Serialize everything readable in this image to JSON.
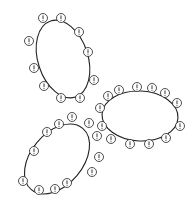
{
  "diagram": {
    "stroke_color": "#222222",
    "background": "#ffffff",
    "marker_glyph": "!",
    "marker_radius": 4.5,
    "loops": [
      {
        "name": "top-left-loop",
        "ellipse": {
          "cx": 63,
          "cy": 59,
          "rx": 25,
          "ry": 40,
          "rotate": -18
        },
        "markers": [
          [
            43,
            18
          ],
          [
            61,
            18
          ],
          [
            79,
            32
          ],
          [
            29,
            41
          ],
          [
            88,
            52
          ],
          [
            34,
            68
          ],
          [
            94,
            80
          ],
          [
            44,
            86
          ],
          [
            61,
            98
          ],
          [
            80,
            98
          ]
        ]
      },
      {
        "name": "right-loop",
        "ellipse": {
          "cx": 140,
          "cy": 116,
          "rx": 38,
          "ry": 25,
          "rotate": 3
        },
        "markers": [
          [
            108,
            96
          ],
          [
            119,
            90
          ],
          [
            137,
            87
          ],
          [
            152,
            88
          ],
          [
            165,
            93
          ],
          [
            177,
            103
          ],
          [
            100,
            108
          ],
          [
            102,
            126
          ],
          [
            180,
            126
          ],
          [
            111,
            139
          ],
          [
            130,
            144
          ],
          [
            149,
            144
          ],
          [
            166,
            138
          ]
        ]
      },
      {
        "name": "bottom-left-loop",
        "ellipse": {
          "cx": 57,
          "cy": 159,
          "rx": 26,
          "ry": 40,
          "rotate": 40
        },
        "markers": [
          [
            72,
            117
          ],
          [
            59,
            124
          ],
          [
            89,
            123
          ],
          [
            47,
            132
          ],
          [
            97,
            136
          ],
          [
            34,
            151
          ],
          [
            99,
            157
          ],
          [
            23,
            181
          ],
          [
            92,
            172
          ],
          [
            67,
            183
          ],
          [
            55,
            189
          ],
          [
            39,
            190
          ]
        ]
      }
    ]
  }
}
